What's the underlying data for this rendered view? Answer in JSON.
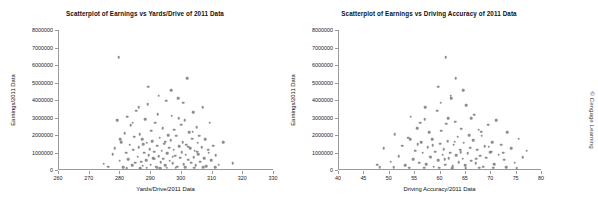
{
  "credit": "© Cengage Learning",
  "charts": [
    {
      "title": "Scatterplot of Earnings vs Yards/Drive of 2011 Data",
      "xlabel": "Yards/Drive/2011 Data",
      "ylabel": "Earnings/2011 Data",
      "xticks": [
        "260",
        "270",
        "280",
        "290",
        "300",
        "310",
        "320",
        "330"
      ],
      "yticks": [
        "0",
        "1000000",
        "2000000",
        "3000000",
        "4000000",
        "5000000",
        "6000000",
        "7000000",
        "8000000"
      ]
    },
    {
      "title": "Scatterplot of Earnings vs Driving Accuracy of 2011 Data",
      "xlabel": "Driving Accuracy/2011 Data",
      "ylabel": "Earnings/2011 Data",
      "xticks": [
        "40",
        "45",
        "50",
        "55",
        "60",
        "65",
        "70",
        "75",
        "80"
      ],
      "yticks": [
        "0",
        "1000000",
        "2000000",
        "3000000",
        "4000000",
        "5000000",
        "6000000",
        "7000000",
        "8000000"
      ]
    }
  ],
  "chart_data": [
    {
      "type": "scatter",
      "title": "Scatterplot of Earnings vs Yards/Drive of 2011 Data",
      "xlabel": "Yards/Drive/2011 Data",
      "ylabel": "Earnings/2011 Data",
      "xlim": [
        260,
        330
      ],
      "ylim": [
        0,
        8000000
      ],
      "grid": false,
      "legend": false,
      "marker_color": "#8d8d8d",
      "points": [
        [
          274.5,
          350000
        ],
        [
          276.0,
          180000
        ],
        [
          277.5,
          900000
        ],
        [
          278.2,
          1250000
        ],
        [
          279.0,
          2850000
        ],
        [
          279.4,
          6450000
        ],
        [
          279.8,
          520000
        ],
        [
          280.3,
          1600000
        ],
        [
          280.9,
          150000
        ],
        [
          281.4,
          2100000
        ],
        [
          281.8,
          980000
        ],
        [
          282.2,
          3050000
        ],
        [
          282.6,
          620000
        ],
        [
          283.0,
          1450000
        ],
        [
          283.4,
          2550000
        ],
        [
          283.8,
          260000
        ],
        [
          284.2,
          1150000
        ],
        [
          284.5,
          1900000
        ],
        [
          284.9,
          420000
        ],
        [
          285.2,
          3400000
        ],
        [
          285.6,
          760000
        ],
        [
          286.0,
          1300000
        ],
        [
          286.3,
          2050000
        ],
        [
          286.7,
          480000
        ],
        [
          287.0,
          1750000
        ],
        [
          287.3,
          240000
        ],
        [
          287.7,
          1000000
        ],
        [
          288.0,
          2900000
        ],
        [
          288.3,
          560000
        ],
        [
          288.6,
          1550000
        ],
        [
          288.9,
          3750000
        ],
        [
          289.2,
          860000
        ],
        [
          289.5,
          1200000
        ],
        [
          289.8,
          310000
        ],
        [
          290.1,
          2250000
        ],
        [
          290.4,
          1650000
        ],
        [
          290.7,
          690000
        ],
        [
          291.0,
          1050000
        ],
        [
          291.3,
          2700000
        ],
        [
          291.6,
          190000
        ],
        [
          291.9,
          1400000
        ],
        [
          292.2,
          3200000
        ],
        [
          292.5,
          800000
        ],
        [
          292.8,
          1850000
        ],
        [
          293.1,
          450000
        ],
        [
          293.4,
          1100000
        ],
        [
          293.7,
          2400000
        ],
        [
          294.0,
          640000
        ],
        [
          294.3,
          1500000
        ],
        [
          294.6,
          280000
        ],
        [
          294.9,
          3950000
        ],
        [
          295.2,
          960000
        ],
        [
          295.5,
          2000000
        ],
        [
          295.8,
          1280000
        ],
        [
          296.1,
          540000
        ],
        [
          296.4,
          1700000
        ],
        [
          296.7,
          3100000
        ],
        [
          297.0,
          380000
        ],
        [
          297.3,
          1150000
        ],
        [
          297.6,
          2300000
        ],
        [
          297.9,
          820000
        ],
        [
          298.2,
          1950000
        ],
        [
          298.5,
          200000
        ],
        [
          298.8,
          4100000
        ],
        [
          299.1,
          1350000
        ],
        [
          299.4,
          700000
        ],
        [
          299.7,
          2600000
        ],
        [
          300.0,
          1020000
        ],
        [
          300.3,
          1600000
        ],
        [
          300.6,
          330000
        ],
        [
          300.9,
          2850000
        ],
        [
          301.2,
          880000
        ],
        [
          301.5,
          1450000
        ],
        [
          301.8,
          5250000
        ],
        [
          302.1,
          580000
        ],
        [
          302.4,
          2150000
        ],
        [
          302.7,
          1250000
        ],
        [
          303.0,
          420000
        ],
        [
          303.3,
          1800000
        ],
        [
          303.6,
          3300000
        ],
        [
          303.9,
          740000
        ],
        [
          304.2,
          1100000
        ],
        [
          304.5,
          260000
        ],
        [
          304.8,
          2450000
        ],
        [
          305.1,
          1550000
        ],
        [
          305.4,
          910000
        ],
        [
          305.7,
          1950000
        ],
        [
          306.0,
          480000
        ],
        [
          306.4,
          1300000
        ],
        [
          306.8,
          3600000
        ],
        [
          307.2,
          680000
        ],
        [
          307.6,
          1750000
        ],
        [
          308.0,
          220000
        ],
        [
          308.5,
          1150000
        ],
        [
          309.0,
          2700000
        ],
        [
          309.6,
          560000
        ],
        [
          310.2,
          1400000
        ],
        [
          311.0,
          840000
        ],
        [
          312.0,
          300000
        ],
        [
          313.5,
          1600000
        ],
        [
          316.5,
          380000
        ],
        [
          310.8,
          160000
        ],
        [
          304.0,
          140000
        ],
        [
          298.0,
          130000
        ],
        [
          292.0,
          120000
        ],
        [
          286.5,
          110000
        ],
        [
          282.0,
          105000
        ],
        [
          288.5,
          125000
        ],
        [
          295.0,
          135000
        ],
        [
          301.0,
          145000
        ],
        [
          307.0,
          155000
        ],
        [
          293.0,
          115000
        ],
        [
          289.0,
          4750000
        ],
        [
          296.5,
          4550000
        ],
        [
          300.5,
          3850000
        ],
        [
          286.0,
          3600000
        ],
        [
          292.5,
          4250000
        ],
        [
          284.0,
          2700000
        ],
        [
          299.0,
          2950000
        ],
        [
          303.5,
          2200000
        ],
        [
          280.0,
          1750000
        ],
        [
          305.0,
          1050000
        ],
        [
          297.0,
          750000
        ],
        [
          291.0,
          650000
        ],
        [
          287.5,
          1480000
        ],
        [
          294.5,
          1620000
        ],
        [
          302.0,
          1320000
        ],
        [
          308.8,
          980000
        ]
      ]
    },
    {
      "type": "scatter",
      "title": "Scatterplot of Earnings vs Driving Accuracy of 2011 Data",
      "xlabel": "Driving Accuracy/2011 Data",
      "ylabel": "Earnings/2011 Data",
      "xlim": [
        40,
        80
      ],
      "ylim": [
        0,
        8000000
      ],
      "grid": false,
      "legend": false,
      "marker_color": "#8d8d8d",
      "points": [
        [
          47.5,
          300000
        ],
        [
          48.8,
          1250000
        ],
        [
          50.2,
          480000
        ],
        [
          51.0,
          2050000
        ],
        [
          51.8,
          800000
        ],
        [
          52.4,
          1400000
        ],
        [
          53.0,
          260000
        ],
        [
          53.6,
          1850000
        ],
        [
          54.1,
          3050000
        ],
        [
          54.6,
          620000
        ],
        [
          55.0,
          1100000
        ],
        [
          55.4,
          2400000
        ],
        [
          55.8,
          420000
        ],
        [
          56.2,
          1600000
        ],
        [
          56.5,
          980000
        ],
        [
          56.9,
          2900000
        ],
        [
          57.2,
          340000
        ],
        [
          57.5,
          1300000
        ],
        [
          57.8,
          2150000
        ],
        [
          58.1,
          720000
        ],
        [
          58.4,
          1750000
        ],
        [
          58.7,
          180000
        ],
        [
          59.0,
          1050000
        ],
        [
          59.3,
          3400000
        ],
        [
          59.6,
          560000
        ],
        [
          59.9,
          1500000
        ],
        [
          60.1,
          2250000
        ],
        [
          60.4,
          880000
        ],
        [
          60.6,
          1200000
        ],
        [
          60.9,
          300000
        ],
        [
          61.1,
          2650000
        ],
        [
          61.4,
          1650000
        ],
        [
          61.6,
          660000
        ],
        [
          61.9,
          1000000
        ],
        [
          62.1,
          4100000
        ],
        [
          62.4,
          220000
        ],
        [
          62.6,
          1450000
        ],
        [
          62.9,
          2750000
        ],
        [
          63.1,
          840000
        ],
        [
          63.4,
          1900000
        ],
        [
          63.6,
          460000
        ],
        [
          63.9,
          1150000
        ],
        [
          64.1,
          2350000
        ],
        [
          64.4,
          640000
        ],
        [
          64.6,
          1550000
        ],
        [
          64.9,
          280000
        ],
        [
          65.1,
          3700000
        ],
        [
          65.4,
          960000
        ],
        [
          65.6,
          2000000
        ],
        [
          65.9,
          1280000
        ],
        [
          66.1,
          540000
        ],
        [
          66.4,
          1700000
        ],
        [
          66.6,
          3150000
        ],
        [
          66.9,
          390000
        ],
        [
          67.2,
          1150000
        ],
        [
          67.5,
          2300000
        ],
        [
          67.8,
          820000
        ],
        [
          68.1,
          1950000
        ],
        [
          68.4,
          200000
        ],
        [
          68.7,
          1350000
        ],
        [
          69.0,
          700000
        ],
        [
          69.4,
          2600000
        ],
        [
          69.8,
          1020000
        ],
        [
          70.2,
          1600000
        ],
        [
          70.6,
          330000
        ],
        [
          71.0,
          2850000
        ],
        [
          71.5,
          880000
        ],
        [
          72.0,
          1450000
        ],
        [
          72.6,
          580000
        ],
        [
          73.2,
          2150000
        ],
        [
          73.9,
          1250000
        ],
        [
          74.6,
          420000
        ],
        [
          75.4,
          1800000
        ],
        [
          76.2,
          740000
        ],
        [
          77.0,
          1100000
        ],
        [
          61.0,
          6450000
        ],
        [
          63.0,
          5250000
        ],
        [
          59.5,
          4750000
        ],
        [
          64.5,
          4550000
        ],
        [
          60.0,
          3850000
        ],
        [
          57.0,
          3600000
        ],
        [
          62.0,
          4250000
        ],
        [
          56.0,
          2700000
        ],
        [
          66.0,
          2950000
        ],
        [
          68.0,
          2200000
        ],
        [
          54.0,
          1750000
        ],
        [
          70.0,
          1050000
        ],
        [
          58.0,
          750000
        ],
        [
          67.0,
          650000
        ],
        [
          55.5,
          1480000
        ],
        [
          62.8,
          1620000
        ],
        [
          69.5,
          1320000
        ],
        [
          72.3,
          980000
        ],
        [
          50.8,
          160000
        ],
        [
          53.8,
          140000
        ],
        [
          56.8,
          130000
        ],
        [
          59.8,
          120000
        ],
        [
          62.3,
          110000
        ],
        [
          65.0,
          105000
        ],
        [
          67.6,
          125000
        ],
        [
          70.4,
          135000
        ],
        [
          73.0,
          145000
        ],
        [
          48.0,
          155000
        ],
        [
          75.0,
          115000
        ],
        [
          61.5,
          2950000
        ],
        [
          64.0,
          1030000
        ],
        [
          58.5,
          1420000
        ],
        [
          60.8,
          620000
        ]
      ]
    }
  ]
}
